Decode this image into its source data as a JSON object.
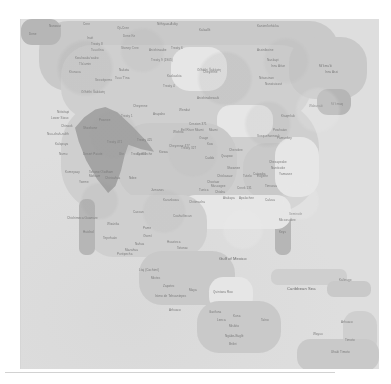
{
  "document": {
    "kind": "map-figure",
    "title": "North America reference map",
    "projection_area": "North America, Central America and the Caribbean",
    "render_quality": "low-resolution, blurred, desaturated grayscale",
    "background_color": "#ffffff",
    "plate_color": "#dedede"
  },
  "palette": {
    "page_background": "#ffffff",
    "ocean": "#dedede",
    "land_pale": "#e6e6e6",
    "land_base": "#cfcfcf",
    "land_mid": "#c8c8c8",
    "land_dark": "#b4b4b4",
    "highlight_region": "#9e9e9e",
    "label_text": "#6e6e6e",
    "edge_rule": "#d2d2d2"
  },
  "plate": {
    "left": 21,
    "top": 19,
    "width": 358,
    "height": 350
  },
  "highlight": {
    "name": "highlighted-region",
    "description": "dark gray polygon overlay across the western interior",
    "color": "#9e9e9e",
    "left": 54,
    "top": 88,
    "width": 92,
    "height": 86
  },
  "landmasses": [
    {
      "name": "canada-arctic",
      "left": 18,
      "top": 2,
      "width": 300,
      "height": 70,
      "tone": "mid"
    },
    {
      "name": "canada-interior",
      "left": 40,
      "top": 26,
      "width": 250,
      "height": 74,
      "tone": "base"
    },
    {
      "name": "alaska-northwest",
      "left": 0,
      "top": 0,
      "width": 40,
      "height": 26,
      "tone": "dark"
    },
    {
      "name": "hudson-bay",
      "left": 150,
      "top": 28,
      "width": 56,
      "height": 44,
      "tone": "pale"
    },
    {
      "name": "labrador-greenland",
      "left": 268,
      "top": 18,
      "width": 78,
      "height": 62,
      "tone": "mid"
    },
    {
      "name": "newfoundland",
      "left": 296,
      "top": 70,
      "width": 34,
      "height": 26,
      "tone": "dark"
    },
    {
      "name": "united-states",
      "left": 40,
      "top": 82,
      "width": 258,
      "height": 112,
      "tone": "base"
    },
    {
      "name": "great-lakes",
      "left": 196,
      "top": 86,
      "width": 56,
      "height": 32,
      "tone": "pale"
    },
    {
      "name": "great-plains",
      "left": 96,
      "top": 104,
      "width": 120,
      "height": 78,
      "tone": "mid"
    },
    {
      "name": "appalachia",
      "left": 222,
      "top": 124,
      "width": 58,
      "height": 56,
      "tone": "mid"
    },
    {
      "name": "atlantic-coast",
      "left": 254,
      "top": 118,
      "width": 44,
      "height": 60,
      "tone": "pale"
    },
    {
      "name": "florida-peninsula",
      "left": 254,
      "top": 184,
      "width": 16,
      "height": 52,
      "tone": "dark"
    },
    {
      "name": "gulf-coast",
      "left": 160,
      "top": 176,
      "width": 110,
      "height": 34,
      "tone": "pale"
    },
    {
      "name": "mexico-north",
      "left": 66,
      "top": 176,
      "width": 120,
      "height": 62,
      "tone": "base"
    },
    {
      "name": "baja-california",
      "left": 58,
      "top": 180,
      "width": 16,
      "height": 56,
      "tone": "dark"
    },
    {
      "name": "mexico-south",
      "left": 118,
      "top": 232,
      "width": 96,
      "height": 54,
      "tone": "mid"
    },
    {
      "name": "yucatan",
      "left": 188,
      "top": 258,
      "width": 44,
      "height": 34,
      "tone": "pale"
    },
    {
      "name": "central-america",
      "left": 176,
      "top": 282,
      "width": 84,
      "height": 52,
      "tone": "mid"
    },
    {
      "name": "cuba",
      "left": 250,
      "top": 250,
      "width": 76,
      "height": 16,
      "tone": "base"
    },
    {
      "name": "hispaniola",
      "left": 306,
      "top": 262,
      "width": 44,
      "height": 16,
      "tone": "mid"
    },
    {
      "name": "lesser-antilles",
      "left": 322,
      "top": 292,
      "width": 34,
      "height": 44,
      "tone": "base"
    },
    {
      "name": "south-america-tip",
      "left": 276,
      "top": 320,
      "width": 82,
      "height": 32,
      "tone": "mid"
    }
  ],
  "labels": [
    {
      "text": "Nunavut",
      "left": 28,
      "top": 6,
      "size": "sm"
    },
    {
      "text": "Dene",
      "left": 8,
      "top": 14,
      "size": "sm"
    },
    {
      "text": "Cree",
      "left": 62,
      "top": 4,
      "size": "sm"
    },
    {
      "text": "Oji-Cree",
      "left": 96,
      "top": 8,
      "size": "sm"
    },
    {
      "text": "Dene Ke",
      "left": 102,
      "top": 16,
      "size": "sm"
    },
    {
      "text": "Nêhiyaw-Askiy",
      "left": 136,
      "top": 4,
      "size": "sm"
    },
    {
      "text": "Kalaallit",
      "left": 178,
      "top": 10,
      "size": "sm"
    },
    {
      "text": "Kanien'kehá:ka",
      "left": 236,
      "top": 6,
      "size": "sm"
    },
    {
      "text": "Inuit",
      "left": 66,
      "top": 18,
      "size": "sm"
    },
    {
      "text": "Tsuut'ina",
      "left": 70,
      "top": 30,
      "size": "sm"
    },
    {
      "text": "Stoney Cree",
      "left": 100,
      "top": 28,
      "size": "sm"
    },
    {
      "text": "Anishinaabe",
      "left": 128,
      "top": 30,
      "size": "sm"
    },
    {
      "text": "Treaty 6",
      "left": 150,
      "top": 28,
      "size": "sm"
    },
    {
      "text": "Treaty 8",
      "left": 70,
      "top": 24,
      "size": "sm"
    },
    {
      "text": "Treaty 9 (1905)",
      "left": 130,
      "top": 40,
      "size": "sm"
    },
    {
      "text": "Kwakwaka'wakw",
      "left": 54,
      "top": 38,
      "size": "sm"
    },
    {
      "text": "Tla'amin",
      "left": 58,
      "top": 44,
      "size": "sm"
    },
    {
      "text": "Ktunaxa",
      "left": 48,
      "top": 52,
      "size": "sm"
    },
    {
      "text": "Nakota",
      "left": 98,
      "top": 50,
      "size": "sm"
    },
    {
      "text": "Secwépemc",
      "left": 74,
      "top": 60,
      "size": "sm"
    },
    {
      "text": "Tsuu T'ina",
      "left": 94,
      "top": 58,
      "size": "sm"
    },
    {
      "text": "Kaskaskia",
      "left": 146,
      "top": 56,
      "size": "sm"
    },
    {
      "text": "Treaty 4",
      "left": 142,
      "top": 66,
      "size": "sm"
    },
    {
      "text": "Cheyenne",
      "left": 182,
      "top": 52,
      "size": "sm"
    },
    {
      "text": "Očhéthi Šakówiŋ",
      "left": 176,
      "top": 50,
      "size": "sm"
    },
    {
      "text": "Assiniboine",
      "left": 236,
      "top": 30,
      "size": "sm"
    },
    {
      "text": "Naskapi",
      "left": 246,
      "top": 40,
      "size": "sm"
    },
    {
      "text": "Innu Aitun",
      "left": 250,
      "top": 46,
      "size": "sm"
    },
    {
      "text": "Nitassinan",
      "left": 238,
      "top": 58,
      "size": "sm"
    },
    {
      "text": "Nunatsiavut",
      "left": 244,
      "top": 64,
      "size": "sm"
    },
    {
      "text": "Mi'kma'ki",
      "left": 298,
      "top": 46,
      "size": "sm"
    },
    {
      "text": "Innu Assi",
      "left": 304,
      "top": 52,
      "size": "sm"
    },
    {
      "text": "Wabanaki",
      "left": 288,
      "top": 86,
      "size": "sm"
    },
    {
      "text": "Mi'kmaq",
      "left": 310,
      "top": 84,
      "size": "sm"
    },
    {
      "text": "Ktaqmkuk",
      "left": 260,
      "top": 96,
      "size": "sm"
    },
    {
      "text": "Wendat",
      "left": 158,
      "top": 90,
      "size": "sm"
    },
    {
      "text": "Anishinabewaki",
      "left": 176,
      "top": 78,
      "size": "sm"
    },
    {
      "text": "Očhéthi Šakówiŋ",
      "left": 60,
      "top": 72,
      "size": "sm"
    },
    {
      "text": "Niitsitapi",
      "left": 36,
      "top": 92,
      "size": "sm"
    },
    {
      "text": "Lower Sioux",
      "left": 30,
      "top": 98,
      "size": "sm"
    },
    {
      "text": "Chinook",
      "left": 40,
      "top": 106,
      "size": "sm"
    },
    {
      "text": "Nuu-chah-nulth",
      "left": 26,
      "top": 114,
      "size": "sm"
    },
    {
      "text": "Kalapuya",
      "left": 34,
      "top": 124,
      "size": "sm"
    },
    {
      "text": "Numu",
      "left": 38,
      "top": 134,
      "size": "sm"
    },
    {
      "text": "Treaty 1",
      "left": 100,
      "top": 96,
      "size": "sm"
    },
    {
      "text": "Cheyenne",
      "left": 112,
      "top": 86,
      "size": "sm"
    },
    {
      "text": "Arapaho",
      "left": 132,
      "top": 94,
      "size": "sm"
    },
    {
      "text": "Pawnee",
      "left": 78,
      "top": 100,
      "size": "sm"
    },
    {
      "text": "Shoshone",
      "left": 62,
      "top": 108,
      "size": "sm"
    },
    {
      "text": "Treaty 471",
      "left": 86,
      "top": 122,
      "size": "sm"
    },
    {
      "text": "Treaty 425",
      "left": 116,
      "top": 120,
      "size": "sm"
    },
    {
      "text": "Ute",
      "left": 98,
      "top": 134,
      "size": "sm"
    },
    {
      "text": "Comanche",
      "left": 116,
      "top": 134,
      "size": "sm"
    },
    {
      "text": "Desert Paiute",
      "left": 62,
      "top": 134,
      "size": "sm"
    },
    {
      "text": "Treaty 477",
      "left": 110,
      "top": 134,
      "size": "sm"
    },
    {
      "text": "Kiowa",
      "left": 138,
      "top": 132,
      "size": "sm"
    },
    {
      "text": "Cheyenne 477",
      "left": 148,
      "top": 126,
      "size": "sm"
    },
    {
      "text": "Treaty 327",
      "left": 160,
      "top": 128,
      "size": "sm"
    },
    {
      "text": "Kaw",
      "left": 186,
      "top": 124,
      "size": "sm"
    },
    {
      "text": "Osage",
      "left": 178,
      "top": 118,
      "size": "sm"
    },
    {
      "text": "Wichita",
      "left": 152,
      "top": 112,
      "size": "sm"
    },
    {
      "text": "Eel River Miami",
      "left": 160,
      "top": 110,
      "size": "sm"
    },
    {
      "text": "Cession 371",
      "left": 168,
      "top": 104,
      "size": "sm"
    },
    {
      "text": "Miami",
      "left": 188,
      "top": 110,
      "size": "sm"
    },
    {
      "text": "Caddo",
      "left": 184,
      "top": 138,
      "size": "sm"
    },
    {
      "text": "Quapaw",
      "left": 200,
      "top": 136,
      "size": "sm"
    },
    {
      "text": "Cherokee",
      "left": 208,
      "top": 130,
      "size": "sm"
    },
    {
      "text": "Shawnee",
      "left": 206,
      "top": 148,
      "size": "sm"
    },
    {
      "text": "Chickasaw",
      "left": 196,
      "top": 156,
      "size": "sm"
    },
    {
      "text": "Choctaw",
      "left": 186,
      "top": 162,
      "size": "sm"
    },
    {
      "text": "Tunica",
      "left": 178,
      "top": 170,
      "size": "sm"
    },
    {
      "text": "Susquehannock",
      "left": 236,
      "top": 116,
      "size": "sm"
    },
    {
      "text": "Pamunkey",
      "left": 256,
      "top": 118,
      "size": "sm"
    },
    {
      "text": "Powhatan",
      "left": 252,
      "top": 110,
      "size": "sm"
    },
    {
      "text": "Chesapeake",
      "left": 248,
      "top": 142,
      "size": "sm"
    },
    {
      "text": "Nanticoke",
      "left": 250,
      "top": 148,
      "size": "sm"
    },
    {
      "text": "Catawba",
      "left": 232,
      "top": 154,
      "size": "sm"
    },
    {
      "text": "Tutelo",
      "left": 222,
      "top": 156,
      "size": "sm"
    },
    {
      "text": "Eugene",
      "left": 236,
      "top": 156,
      "size": "sm"
    },
    {
      "text": "Yamasee",
      "left": 258,
      "top": 154,
      "size": "sm"
    },
    {
      "text": "Muscogee",
      "left": 190,
      "top": 166,
      "size": "sm"
    },
    {
      "text": "Creek 131",
      "left": 216,
      "top": 168,
      "size": "sm"
    },
    {
      "text": "Chiaha",
      "left": 194,
      "top": 172,
      "size": "sm"
    },
    {
      "text": "Apalachee",
      "left": 218,
      "top": 178,
      "size": "sm"
    },
    {
      "text": "Atakapa",
      "left": 202,
      "top": 178,
      "size": "sm"
    },
    {
      "text": "Timucua",
      "left": 244,
      "top": 166,
      "size": "sm"
    },
    {
      "text": "Calusa",
      "left": 244,
      "top": 180,
      "size": "sm"
    },
    {
      "text": "Seminole",
      "left": 268,
      "top": 194,
      "size": "sm"
    },
    {
      "text": "Miccosukee",
      "left": 258,
      "top": 200,
      "size": "sm"
    },
    {
      "text": "Keys",
      "left": 258,
      "top": 212,
      "size": "sm"
    },
    {
      "text": "Chitimacha",
      "left": 168,
      "top": 182,
      "size": "sm"
    },
    {
      "text": "Karankawa",
      "left": 142,
      "top": 180,
      "size": "sm"
    },
    {
      "text": "Jumanos",
      "left": 130,
      "top": 170,
      "size": "sm"
    },
    {
      "text": "Ndee",
      "left": 108,
      "top": 158,
      "size": "sm"
    },
    {
      "text": "Chiricahua",
      "left": 84,
      "top": 158,
      "size": "sm"
    },
    {
      "text": "Mohave",
      "left": 68,
      "top": 156,
      "size": "sm"
    },
    {
      "text": "Yoeme",
      "left": 58,
      "top": 162,
      "size": "sm"
    },
    {
      "text": "Tohono O'odham",
      "left": 68,
      "top": 152,
      "size": "sm"
    },
    {
      "text": "Kumeyaay",
      "left": 44,
      "top": 152,
      "size": "sm"
    },
    {
      "text": "Caxcan",
      "left": 112,
      "top": 192,
      "size": "sm"
    },
    {
      "text": "Chichimeca Guamare",
      "left": 46,
      "top": 198,
      "size": "sm"
    },
    {
      "text": "Wixárika",
      "left": 86,
      "top": 204,
      "size": "sm"
    },
    {
      "text": "Coahuiltecan",
      "left": 152,
      "top": 196,
      "size": "sm"
    },
    {
      "text": "Pame",
      "left": 122,
      "top": 208,
      "size": "sm"
    },
    {
      "text": "Huichol",
      "left": 62,
      "top": 212,
      "size": "sm"
    },
    {
      "text": "Tepehuán",
      "left": 82,
      "top": 218,
      "size": "sm"
    },
    {
      "text": "Otomí",
      "left": 122,
      "top": 216,
      "size": "sm"
    },
    {
      "text": "Nahua",
      "left": 114,
      "top": 224,
      "size": "sm"
    },
    {
      "text": "Huasteca",
      "left": 146,
      "top": 222,
      "size": "sm"
    },
    {
      "text": "Totonac",
      "left": 156,
      "top": 228,
      "size": "sm"
    },
    {
      "text": "Mazahua",
      "left": 104,
      "top": 230,
      "size": "sm"
    },
    {
      "text": "Purépecha",
      "left": 96,
      "top": 234,
      "size": "sm"
    },
    {
      "text": "Ltaj (Cochimí)",
      "left": 118,
      "top": 250,
      "size": "sm"
    },
    {
      "text": "Mixtec",
      "left": 130,
      "top": 258,
      "size": "sm"
    },
    {
      "text": "Zapotec",
      "left": 142,
      "top": 266,
      "size": "sm"
    },
    {
      "text": "Istmo de Tehuantepec",
      "left": 134,
      "top": 276,
      "size": "sm"
    },
    {
      "text": "Maya",
      "left": 168,
      "top": 270,
      "size": "sm"
    },
    {
      "text": "Arhuaco",
      "left": 148,
      "top": 290,
      "size": "sm"
    },
    {
      "text": "Gulf of Mexico",
      "left": 198,
      "top": 238,
      "size": "lg"
    },
    {
      "text": "Quintana Roo",
      "left": 192,
      "top": 272,
      "size": "sm"
    },
    {
      "text": "Kuna",
      "left": 212,
      "top": 296,
      "size": "sm"
    },
    {
      "text": "Garifuna",
      "left": 188,
      "top": 292,
      "size": "sm"
    },
    {
      "text": "Lenca",
      "left": 196,
      "top": 300,
      "size": "sm"
    },
    {
      "text": "Miskito",
      "left": 208,
      "top": 306,
      "size": "sm"
    },
    {
      "text": "Ngäbe-Buglé",
      "left": 204,
      "top": 316,
      "size": "sm"
    },
    {
      "text": "Bribri",
      "left": 208,
      "top": 324,
      "size": "sm"
    },
    {
      "text": "Taíno",
      "left": 240,
      "top": 300,
      "size": "sm"
    },
    {
      "text": "Caribbean Sea",
      "left": 266,
      "top": 268,
      "size": "lg"
    },
    {
      "text": "Kalinago",
      "left": 318,
      "top": 260,
      "size": "sm"
    },
    {
      "text": "Wayuu",
      "left": 292,
      "top": 314,
      "size": "sm"
    },
    {
      "text": "Arhuaco",
      "left": 320,
      "top": 302,
      "size": "sm"
    },
    {
      "text": "Timoto",
      "left": 324,
      "top": 320,
      "size": "sm"
    },
    {
      "text": "Uhaki Timoto",
      "left": 310,
      "top": 332,
      "size": "sm"
    }
  ]
}
